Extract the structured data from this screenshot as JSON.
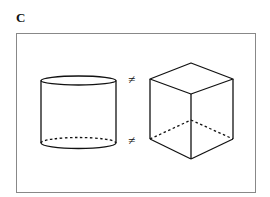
{
  "panel": {
    "label": "C"
  },
  "figure": {
    "shapes": [
      {
        "name": "cylinder",
        "hidden_edges": "dashed"
      },
      {
        "name": "cube",
        "hidden_edges": "dashed"
      }
    ],
    "relation_symbols": [
      "≠",
      "≠"
    ]
  },
  "colors": {
    "stroke": "#111111",
    "frame": "#888888",
    "background": "#ffffff"
  }
}
